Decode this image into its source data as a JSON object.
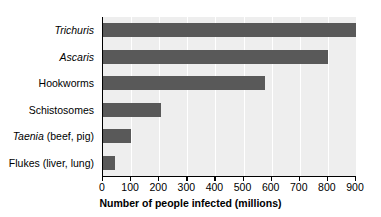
{
  "chart_data": {
    "type": "bar",
    "orientation": "horizontal",
    "title": "",
    "xlabel": "Number of people infected (millions)",
    "ylabel": "",
    "categories": [
      "Trichuris",
      "Ascaris",
      "Hookworms",
      "Schistosomes",
      "Taenia (beef, pig)",
      "Flukes (liver, lung)"
    ],
    "values": [
      900,
      800,
      578,
      207,
      100,
      42
    ],
    "xlim": [
      0,
      900
    ],
    "xticks": [
      0,
      100,
      200,
      300,
      400,
      500,
      600,
      700,
      800,
      900
    ],
    "xtick_labels": [
      "0",
      "100",
      "200",
      "300",
      "400",
      "500",
      "600",
      "700",
      "800",
      "900"
    ],
    "grid": "vertical-white-gridlines",
    "legend": "none",
    "bar_color": "#595959",
    "plot_background": "#eeeeee",
    "gridline_color": "#ffffff",
    "axis_color": "#000000"
  },
  "axis": {
    "x_title": "Number of people infected (millions)"
  },
  "category_labels": [
    {
      "italic_part": "Trichuris",
      "roman_part": ""
    },
    {
      "italic_part": "Ascaris",
      "roman_part": ""
    },
    {
      "italic_part": "",
      "roman_part": "Hookworms"
    },
    {
      "italic_part": "",
      "roman_part": "Schistosomes"
    },
    {
      "italic_part": "Taenia",
      "roman_part": " (beef, pig)"
    },
    {
      "italic_part": "",
      "roman_part": "Flukes (liver, lung)"
    }
  ]
}
